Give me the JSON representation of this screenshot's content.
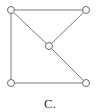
{
  "diagram": {
    "type": "graph",
    "caption": "C.",
    "colors": {
      "edge": "#7a7a7a",
      "node_stroke": "#6a6a6a",
      "node_fill": "#ffffff",
      "text": "#333333"
    },
    "nodes": [
      {
        "id": "top-left",
        "x": 11,
        "y": 10
      },
      {
        "id": "top-right",
        "x": 86,
        "y": 10
      },
      {
        "id": "center",
        "x": 49,
        "y": 46
      },
      {
        "id": "bottom-left",
        "x": 11,
        "y": 83
      },
      {
        "id": "bottom-right",
        "x": 86,
        "y": 83
      }
    ],
    "edges": [
      {
        "from": "top-left",
        "to": "top-right"
      },
      {
        "from": "top-left",
        "to": "bottom-left"
      },
      {
        "from": "top-left",
        "to": "center"
      },
      {
        "from": "top-right",
        "to": "center"
      },
      {
        "from": "center",
        "to": "bottom-right"
      },
      {
        "from": "bottom-left",
        "to": "bottom-right"
      }
    ],
    "node_radius": 3.5
  }
}
